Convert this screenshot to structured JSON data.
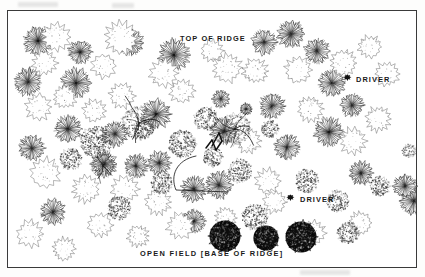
{
  "figure": {
    "domain": "scanned-illustration",
    "background_color": "#ffffff",
    "ink_color": "#1a1a1a",
    "frame": {
      "stroke": "#3a3a3a",
      "x": 7,
      "y": 10,
      "width": 410,
      "height": 258
    }
  },
  "labels": {
    "top_of_ridge": "TOP OF RIDGE",
    "driver_1": "DRIVER",
    "driver_2": "DRIVER",
    "open_field": "OPEN FIELD  [BASE OF RIDGE]"
  },
  "markers": [
    {
      "name": "driver-marker-1",
      "label": "DRIVER",
      "x": 343,
      "y": 74
    },
    {
      "name": "driver-marker-2",
      "label": "DRIVER",
      "x": 286,
      "y": 194
    }
  ],
  "chart_data": {
    "type": "scatter",
    "xlabel": "",
    "ylabel": "",
    "annotations": [
      {
        "text": "TOP OF RIDGE",
        "x": 180,
        "y": 35
      },
      {
        "text": "DRIVER",
        "x": 356,
        "y": 76
      },
      {
        "text": "DRIVER",
        "x": 300,
        "y": 196
      },
      {
        "text": "OPEN FIELD  [BASE OF RIDGE]",
        "x": 140,
        "y": 250
      }
    ],
    "legend_position": "none",
    "grid": false,
    "canopy_types": {
      "radial": "dark radial-spoke crown",
      "lobed": "light scalloped outline crown",
      "stipple": "medium stippled crown",
      "dark": "solid dark stippled crown",
      "branch": "sparse branching skeleton crown"
    },
    "series": [
      {
        "name": "radial",
        "points": [
          [
            30,
            30,
            15
          ],
          [
            72,
            41,
            12
          ],
          [
            20,
            71,
            14
          ],
          [
            68,
            72,
            15
          ],
          [
            123,
            32,
            13
          ],
          [
            166,
            44,
            16
          ],
          [
            148,
            103,
            15
          ],
          [
            107,
            123,
            13
          ],
          [
            60,
            118,
            14
          ],
          [
            24,
            137,
            13
          ],
          [
            96,
            153,
            13
          ],
          [
            128,
            155,
            12
          ],
          [
            151,
            152,
            12
          ],
          [
            211,
            174,
            14
          ],
          [
            216,
            120,
            14
          ],
          [
            186,
            178,
            13
          ],
          [
            256,
            31,
            13
          ],
          [
            283,
            23,
            14
          ],
          [
            309,
            40,
            13
          ],
          [
            264,
            95,
            13
          ],
          [
            324,
            72,
            14
          ],
          [
            279,
            136,
            13
          ],
          [
            321,
            121,
            15
          ],
          [
            353,
            162,
            12
          ],
          [
            213,
            88,
            9
          ],
          [
            406,
            190,
            14
          ],
          [
            344,
            94,
            12
          ],
          [
            186,
            210,
            12
          ],
          [
            45,
            201,
            13
          ],
          [
            238,
            98,
            6
          ]
        ]
      },
      {
        "name": "lobed",
        "points": [
          [
            48,
            26,
            15
          ],
          [
            113,
            27,
            17
          ],
          [
            37,
            52,
            13
          ],
          [
            96,
            55,
            13
          ],
          [
            156,
            62,
            15
          ],
          [
            219,
            57,
            15
          ],
          [
            204,
            40,
            12
          ],
          [
            247,
            60,
            13
          ],
          [
            290,
            59,
            14
          ],
          [
            335,
            52,
            14
          ],
          [
            362,
            36,
            12
          ],
          [
            379,
            63,
            13
          ],
          [
            30,
            96,
            14
          ],
          [
            57,
            86,
            12
          ],
          [
            86,
            100,
            12
          ],
          [
            114,
            85,
            13
          ],
          [
            174,
            80,
            13
          ],
          [
            240,
            130,
            13
          ],
          [
            260,
            170,
            13
          ],
          [
            302,
            98,
            13
          ],
          [
            345,
            130,
            14
          ],
          [
            370,
            108,
            13
          ],
          [
            37,
            162,
            16
          ],
          [
            78,
            178,
            14
          ],
          [
            117,
            178,
            14
          ],
          [
            150,
            191,
            13
          ],
          [
            172,
            215,
            14
          ],
          [
            218,
            207,
            11
          ],
          [
            305,
            222,
            13
          ],
          [
            352,
            212,
            12
          ],
          [
            22,
            223,
            14
          ],
          [
            56,
            238,
            12
          ],
          [
            92,
            214,
            13
          ],
          [
            130,
            225,
            11
          ],
          [
            267,
            191,
            12
          ]
        ]
      },
      {
        "name": "stipple",
        "points": [
          [
            88,
            131,
            16
          ],
          [
            174,
            133,
            14
          ],
          [
            198,
            108,
            12
          ],
          [
            136,
            118,
            10
          ],
          [
            232,
            160,
            12
          ],
          [
            299,
            170,
            12
          ],
          [
            330,
            190,
            11
          ],
          [
            247,
            206,
            13
          ],
          [
            63,
            148,
            11
          ],
          [
            205,
            146,
            10
          ],
          [
            372,
            175,
            10
          ],
          [
            262,
            118,
            9
          ],
          [
            154,
            172,
            11
          ],
          [
            111,
            197,
            12
          ],
          [
            340,
            222,
            11
          ]
        ]
      },
      {
        "name": "dark",
        "points": [
          [
            217,
            225,
            16
          ],
          [
            258,
            227,
            13
          ],
          [
            293,
            226,
            16
          ]
        ]
      },
      {
        "name": "branch",
        "points": [
          [
            131,
            112,
            17
          ],
          [
            227,
            118,
            16
          ],
          [
            95,
            155,
            12
          ]
        ]
      }
    ],
    "path_annotation": {
      "name": "hand-drawn-route",
      "description": "curved hook line with zigzag tick marks"
    }
  }
}
